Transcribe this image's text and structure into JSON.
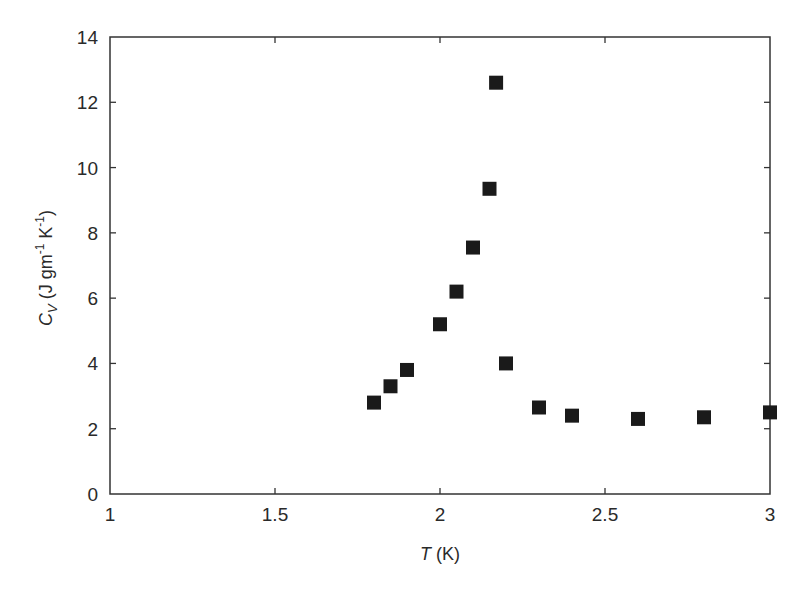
{
  "chart_data": {
    "type": "scatter",
    "title": "",
    "xlabel": "T (K)",
    "xlabel_parts": {
      "italic": "T",
      "rest": " (K)"
    },
    "ylabel": "Cv (J gm-1 K-1)",
    "ylabel_parts": {
      "c": "C",
      "sub": "V",
      "mid": " (J gm",
      "sup1": "-1",
      "mid2": " K",
      "sup2": "-1",
      "end": ")"
    },
    "xlim": [
      1,
      3
    ],
    "ylim": [
      0,
      14
    ],
    "xticks": [
      1,
      1.5,
      2,
      2.5,
      3
    ],
    "xtick_labels": [
      "1",
      "1.5",
      "2",
      "2.5",
      "3"
    ],
    "yticks": [
      0,
      2,
      4,
      6,
      8,
      10,
      12,
      14
    ],
    "ytick_labels": [
      "0",
      "2",
      "4",
      "6",
      "8",
      "10",
      "12",
      "14"
    ],
    "grid": false,
    "legend": null,
    "marker": "square",
    "marker_color": "#1a1a1a",
    "series": [
      {
        "name": "Cv",
        "x": [
          1.8,
          1.85,
          1.9,
          2.0,
          2.05,
          2.1,
          2.15,
          2.17,
          2.2,
          2.3,
          2.4,
          2.6,
          2.8,
          3.0
        ],
        "y": [
          2.8,
          3.3,
          3.8,
          5.2,
          6.2,
          7.55,
          9.35,
          12.6,
          4.0,
          2.65,
          2.4,
          2.3,
          2.35,
          2.5
        ]
      }
    ]
  }
}
